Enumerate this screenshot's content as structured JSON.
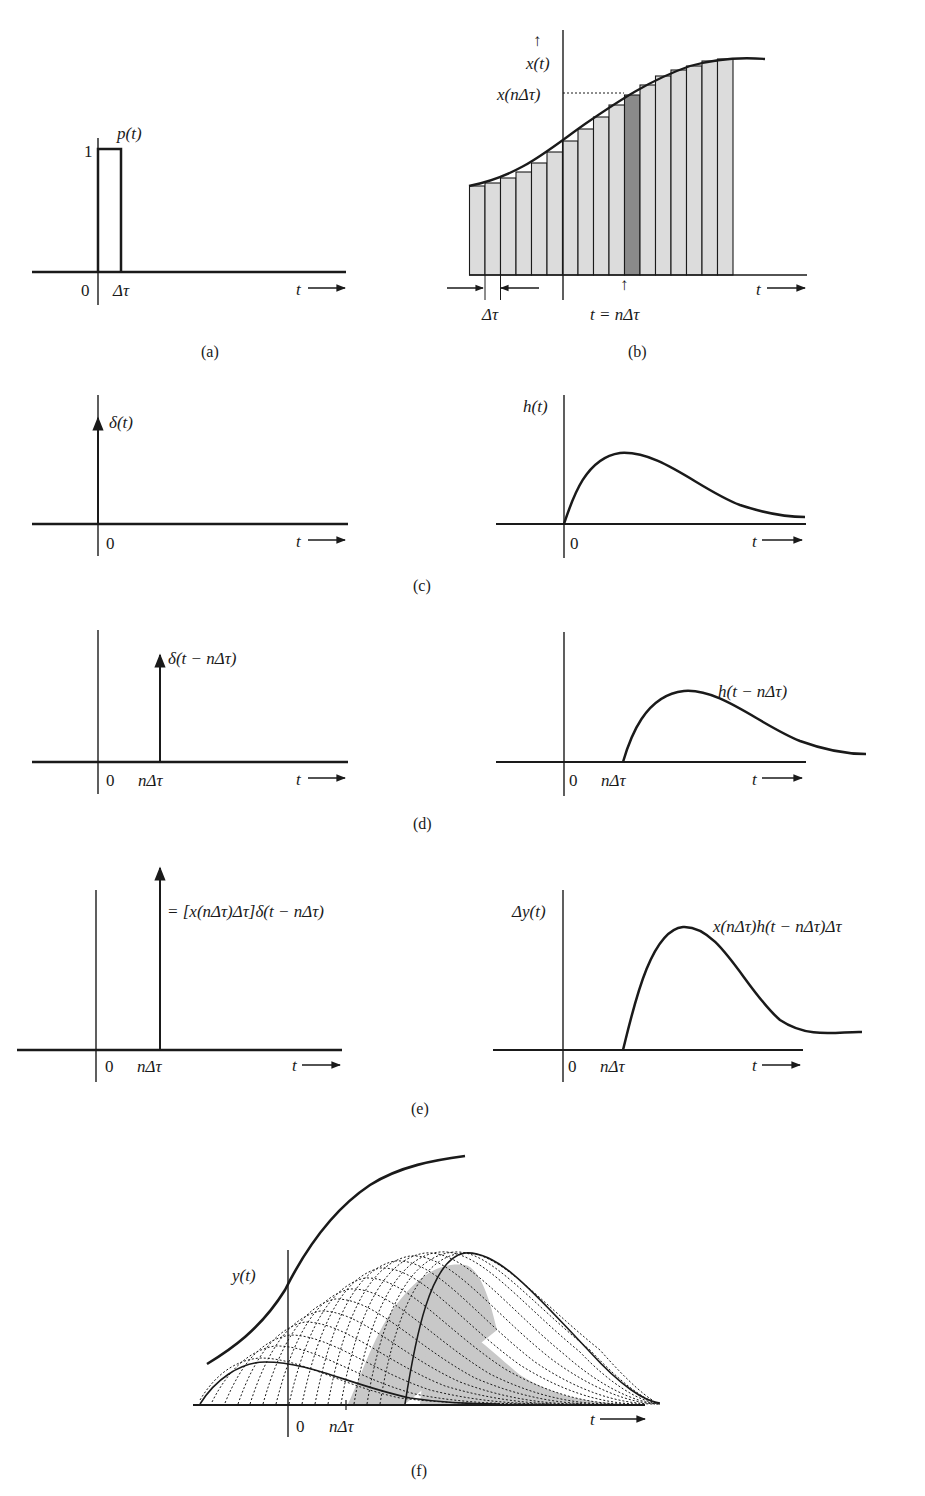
{
  "panels": {
    "a": {
      "caption": "(a)",
      "signal_label": "p(t)",
      "amplitude_label": "1",
      "origin_label": "0",
      "width_label": "Δτ",
      "axis_label": "t ⟶"
    },
    "b": {
      "caption": "(b)",
      "y_arrow": "↑",
      "signal_label": "x(t)",
      "sample_label": "x(nΔτ)",
      "width_label": "Δτ",
      "time_label": "t = nΔτ",
      "time_arrow": "↑",
      "axis_label": "t ⟶",
      "num_strips": 17,
      "highlighted_strip": 10,
      "strip_fill": "#dcdcdc",
      "highlight_fill": "#8a8a8a"
    },
    "c": {
      "caption": "(c)",
      "left": {
        "signal_label": "δ(t)",
        "origin_label": "0",
        "axis_label": "t ⟶"
      },
      "right": {
        "signal_label": "h(t)",
        "origin_label": "0",
        "axis_label": "t ⟶"
      }
    },
    "d": {
      "caption": "(d)",
      "left": {
        "signal_label": "δ(t − nΔτ)",
        "origin_label": "0",
        "shift_label": "nΔτ",
        "axis_label": "t ⟶"
      },
      "right": {
        "signal_label": "h(t − nΔτ)",
        "origin_label": "0",
        "shift_label": "nΔτ",
        "axis_label": "t ⟶"
      }
    },
    "e": {
      "caption": "(e)",
      "left": {
        "signal_label": "= [x(nΔτ)Δτ]δ(t − nΔτ)",
        "origin_label": "0",
        "shift_label": "nΔτ",
        "axis_label": "t ⟶"
      },
      "right": {
        "y_label": "Δy(t)",
        "signal_label": "x(nΔτ)h(t − nΔτ)Δτ",
        "origin_label": "0",
        "shift_label": "nΔτ",
        "axis_label": "t ⟶"
      }
    },
    "f": {
      "caption": "(f)",
      "signal_label": "y(t)",
      "origin_label": "0",
      "shift_label": "nΔτ",
      "axis_label": "t ⟶",
      "shade_fill": "#c8c8c8"
    }
  }
}
